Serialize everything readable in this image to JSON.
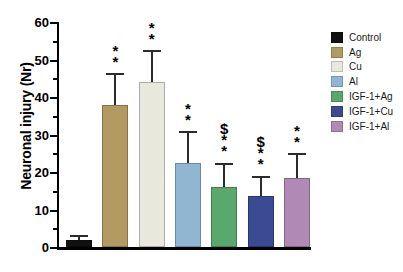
{
  "chart_data": {
    "type": "bar",
    "title": "",
    "xlabel": "",
    "ylabel": "Neuronal injury (Nr)",
    "ylim": [
      0,
      60
    ],
    "ytick_major": [
      0,
      10,
      20,
      30,
      40,
      50,
      60
    ],
    "ytick_minor": [
      5,
      15,
      25,
      35,
      45,
      55
    ],
    "grid": false,
    "legend_position": "right",
    "categories": [
      "Control",
      "Ag",
      "Cu",
      "Al",
      "IGF-1+Ag",
      "IGF-1+Cu",
      "IGF-1+Al"
    ],
    "values": [
      2,
      38,
      44,
      22.5,
      16,
      13.5,
      18.5
    ],
    "errors": [
      1.3,
      8.5,
      8.5,
      8.5,
      6.5,
      5.5,
      6.5
    ],
    "colors": [
      "#111111",
      "#b39a63",
      "#e8e8dc",
      "#8fb7d4",
      "#5aa96c",
      "#3a4b93",
      "#b089b5"
    ],
    "annotations": [
      "",
      "**",
      "**",
      "**",
      "$**",
      "$**",
      "**"
    ]
  },
  "axis": {
    "y_title": "Neuronal injury (Nr)",
    "y_tick_labels": [
      "0",
      "10",
      "20",
      "30",
      "40",
      "50",
      "60"
    ]
  },
  "legend": {
    "items": [
      {
        "label": "Control",
        "color": "#111111"
      },
      {
        "label": "Ag",
        "color": "#b39a63"
      },
      {
        "label": "Cu",
        "color": "#e8e8dc"
      },
      {
        "label": "Al",
        "color": "#8fb7d4"
      },
      {
        "label": "IGF-1+Ag",
        "color": "#5aa96c"
      },
      {
        "label": "IGF-1+Cu",
        "color": "#3a4b93"
      },
      {
        "label": "IGF-1+Al",
        "color": "#b089b5"
      }
    ]
  }
}
